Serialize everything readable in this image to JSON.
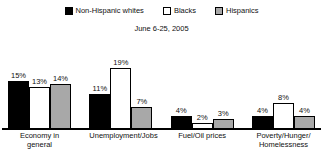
{
  "chart_data": {
    "type": "bar",
    "title": "",
    "subtitle": "June 6-25, 2005",
    "xlabel": "",
    "ylabel": "",
    "ylim": [
      0,
      20
    ],
    "grid": false,
    "legend_position": "top-center",
    "value_suffix": "%",
    "categories": [
      "Economy in general",
      "Unemployment/Jobs",
      "Fuel/Oil prices",
      "Poverty/Hunger/\nHomelessness"
    ],
    "series": [
      {
        "name": "Non-Hispanic whites",
        "color": "#000000",
        "swatch": "sw-black",
        "values": [
          15,
          11,
          4,
          4
        ],
        "labels": [
          "15%",
          "11%",
          "4%",
          "4%"
        ]
      },
      {
        "name": "Blacks",
        "color": "#ffffff",
        "swatch": "sw-white",
        "values": [
          13,
          19,
          2,
          8
        ],
        "labels": [
          "13%",
          "19%",
          "2%",
          "8%"
        ]
      },
      {
        "name": "Hispanics",
        "color": "#a8a8a8",
        "swatch": "sw-gray",
        "values": [
          14,
          7,
          3,
          4
        ],
        "labels": [
          "14%",
          "7%",
          "3%",
          "4%"
        ]
      }
    ]
  }
}
